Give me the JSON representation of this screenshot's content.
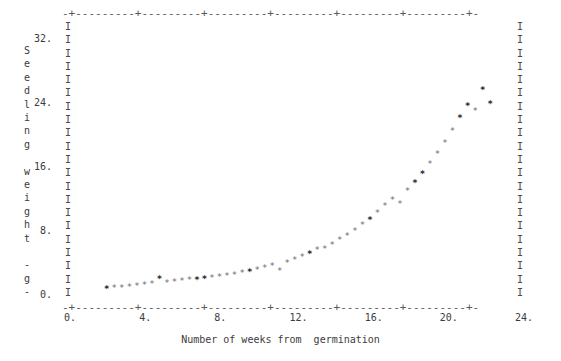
{
  "figure": {
    "title": "",
    "axis_glyph": "I",
    "top_rule": "-+---------+---------+---------+---------+---------+---------+-",
    "bottom_rule": "-+---------+---------+---------+---------+---------+---------+-",
    "y_caption_chars": [
      "S",
      "e",
      "e",
      "d",
      "l",
      "i",
      "n",
      "g",
      "",
      "w",
      "e",
      "i",
      "g",
      "h",
      "t",
      "",
      "-",
      "g",
      "-"
    ],
    "y_caption_text": "Seedling weight - g",
    "x_caption": "Number of weeks from  germination",
    "ink_color": "#4a4a4a",
    "mark_color": "#6d6d6d",
    "mark_color_bold": "#262626",
    "background": "#ffffff"
  },
  "chart_data": {
    "type": "scatter",
    "title": "",
    "xlabel": "Number of weeks from  germination",
    "ylabel": "Seedling weight - g",
    "xlim": [
      0,
      24
    ],
    "ylim": [
      0,
      32
    ],
    "xticks": [
      0,
      4,
      8,
      12,
      16,
      20,
      24
    ],
    "xticklabels": [
      "0.",
      "4.",
      "8.",
      "12.",
      "16.",
      "20.",
      "24."
    ],
    "yticks": [
      0,
      8,
      16,
      24,
      32
    ],
    "yticklabels": [
      "0.",
      "8.",
      "16.",
      "24.",
      "32."
    ],
    "grid": false,
    "legend": null,
    "marker": "*",
    "series": [
      {
        "name": "Seedling weight",
        "x": [
          2.0,
          2.4,
          2.8,
          3.2,
          3.6,
          4.0,
          4.4,
          4.8,
          5.2,
          5.6,
          6.0,
          6.4,
          6.8,
          7.2,
          7.6,
          8.0,
          8.4,
          8.8,
          9.2,
          9.6,
          10.0,
          10.4,
          10.8,
          11.2,
          11.6,
          12.0,
          12.4,
          12.8,
          13.2,
          13.6,
          14.0,
          14.4,
          14.8,
          15.2,
          15.6,
          16.0,
          16.4,
          16.8,
          17.2,
          17.6,
          18.0,
          18.4,
          18.8,
          19.2,
          19.6,
          20.0,
          20.4,
          20.8,
          21.2,
          21.6,
          22.0,
          22.4
        ],
        "y": [
          0.3,
          0.4,
          0.5,
          0.6,
          0.7,
          0.8,
          0.9,
          1.6,
          1.1,
          1.2,
          1.3,
          1.4,
          1.5,
          1.6,
          1.7,
          1.8,
          2.0,
          2.1,
          2.3,
          2.5,
          2.7,
          2.9,
          3.2,
          2.6,
          3.6,
          3.9,
          4.3,
          4.7,
          5.2,
          5.3,
          5.8,
          6.4,
          7.0,
          7.6,
          8.3,
          9.0,
          9.8,
          10.7,
          11.5,
          10.9,
          12.6,
          13.6,
          14.7,
          15.9,
          17.2,
          18.6,
          20.1,
          21.7,
          23.2,
          22.6,
          25.2,
          23.4
        ],
        "bold_points_x": [
          2.0,
          4.8,
          7.0,
          9.6,
          12.9,
          15.9,
          18.6,
          21.0,
          22.2
        ]
      }
    ]
  }
}
